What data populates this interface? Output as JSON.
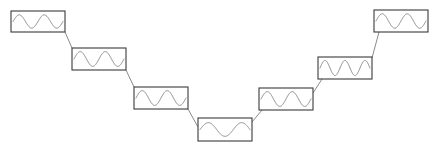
{
  "diagram": {
    "background_color": "#ffffff",
    "box_stroke_color": "#3a3a3a",
    "wave_stroke_color": "#8a8a8a",
    "connector_color": "#8a8a8a",
    "node_count": 7,
    "connector_count": 6,
    "nodes": [
      {
        "id": "node-1",
        "label": "waveform-node-1",
        "x": 11,
        "y": 11,
        "width": 54,
        "height": 21,
        "cycles": 2,
        "phase": 0,
        "amplitude": 0.78
      },
      {
        "id": "node-2",
        "label": "waveform-node-2",
        "x": 72,
        "y": 48,
        "width": 54,
        "height": 22,
        "cycles": 2,
        "phase": 0,
        "amplitude": 0.82
      },
      {
        "id": "node-3",
        "label": "waveform-node-3",
        "x": 134,
        "y": 87,
        "width": 54,
        "height": 22,
        "cycles": 2,
        "phase": 0,
        "amplitude": 0.82
      },
      {
        "id": "node-4",
        "label": "waveform-node-4",
        "x": 198,
        "y": 118,
        "width": 54,
        "height": 23,
        "cycles": 1.5,
        "phase": 0,
        "amplitude": 0.72
      },
      {
        "id": "node-5",
        "label": "waveform-node-5",
        "x": 259,
        "y": 88,
        "width": 54,
        "height": 22,
        "cycles": 2,
        "phase": 0,
        "amplitude": 0.82
      },
      {
        "id": "node-6",
        "label": "waveform-node-6",
        "x": 318,
        "y": 57,
        "width": 54,
        "height": 22,
        "cycles": 2.5,
        "phase": 0,
        "amplitude": 0.84
      },
      {
        "id": "node-7",
        "label": "waveform-node-7",
        "x": 374,
        "y": 10,
        "width": 54,
        "height": 22,
        "cycles": 2,
        "phase": 0,
        "amplitude": 0.8
      }
    ],
    "connectors": [
      {
        "id": "connector-1-2",
        "label": "link-node1-node2",
        "x1": 65,
        "y1": 32,
        "x2": 72,
        "y2": 48
      },
      {
        "id": "connector-2-3",
        "label": "link-node2-node3",
        "x1": 126,
        "y1": 70,
        "x2": 134,
        "y2": 87
      },
      {
        "id": "connector-3-4",
        "label": "link-node3-node4",
        "x1": 188,
        "y1": 109,
        "x2": 198,
        "y2": 127
      },
      {
        "id": "connector-4-5",
        "label": "link-node4-node5",
        "x1": 252,
        "y1": 122,
        "x2": 262,
        "y2": 110
      },
      {
        "id": "connector-5-6",
        "label": "link-node5-node6",
        "x1": 313,
        "y1": 93,
        "x2": 322,
        "y2": 79
      },
      {
        "id": "connector-6-7",
        "label": "link-node6-node7",
        "x1": 372,
        "y1": 58,
        "x2": 379,
        "y2": 32
      }
    ]
  }
}
